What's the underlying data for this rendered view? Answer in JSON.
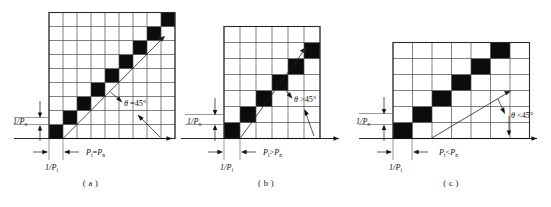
{
  "figure": {
    "panels": [
      {
        "id": "a",
        "caption": "( a )",
        "grid": {
          "cols": 9,
          "rows": 9
        },
        "black_cells": [
          {
            "col": 0,
            "row": 0
          },
          {
            "col": 1,
            "row": 1
          },
          {
            "col": 2,
            "row": 2
          },
          {
            "col": 3,
            "row": 3
          },
          {
            "col": 4,
            "row": 4
          },
          {
            "col": 5,
            "row": 5
          },
          {
            "col": 6,
            "row": 6
          },
          {
            "col": 7,
            "row": 7
          },
          {
            "col": 8,
            "row": 8
          }
        ],
        "angle_label": {
          "symbol": "θ",
          "relation": "=",
          "value": "45°"
        },
        "vertical_label": {
          "numerator": "1/",
          "base": "P",
          "subscript": "n"
        },
        "horizontal_small_label": {
          "numerator": "1/",
          "base": "P",
          "subscript": "i"
        },
        "horizontal_label": {
          "left_base": "P",
          "left_sub": "i",
          "relation": "=",
          "right_base": "P",
          "right_sub": "n"
        }
      },
      {
        "id": "b",
        "caption": "( b )",
        "grid": {
          "cols": 6,
          "rows": 7
        },
        "black_cells": [
          {
            "col": 0,
            "row": 0
          },
          {
            "col": 1,
            "row": 1
          },
          {
            "col": 2,
            "row": 2
          },
          {
            "col": 3,
            "row": 3
          },
          {
            "col": 4,
            "row": 4
          },
          {
            "col": 5,
            "row": 5
          }
        ],
        "angle_label": {
          "symbol": "θ",
          "relation": ">",
          "value": "45°"
        },
        "vertical_label": {
          "numerator": "1/",
          "base": "P",
          "subscript": "n"
        },
        "horizontal_small_label": {
          "numerator": "1/",
          "base": "P",
          "subscript": "i"
        },
        "horizontal_label": {
          "left_base": "P",
          "left_sub": "i",
          "relation": ">",
          "right_base": "P",
          "right_sub": "n"
        }
      },
      {
        "id": "c",
        "caption": "( c )",
        "grid": {
          "cols": 7,
          "rows": 6
        },
        "black_cells": [
          {
            "col": 0,
            "row": 0
          },
          {
            "col": 1,
            "row": 1
          },
          {
            "col": 2,
            "row": 2
          },
          {
            "col": 3,
            "row": 3
          },
          {
            "col": 4,
            "row": 4
          },
          {
            "col": 5,
            "row": 5
          }
        ],
        "angle_label": {
          "symbol": "θ",
          "relation": "<",
          "value": "45°"
        },
        "vertical_label": {
          "numerator": "1/",
          "base": "P",
          "subscript": "n"
        },
        "horizontal_small_label": {
          "numerator": "1/",
          "base": "P",
          "subscript": "i"
        },
        "horizontal_label": {
          "left_base": "P",
          "left_sub": "i",
          "relation": "<",
          "right_base": "P",
          "right_sub": "n"
        }
      }
    ],
    "colors": {
      "cell_fill": "#0c0c0c",
      "grid_line": "#4a4a4a",
      "border": "#2b2b2b",
      "axis": "#111111",
      "background": "#ffffff"
    }
  }
}
